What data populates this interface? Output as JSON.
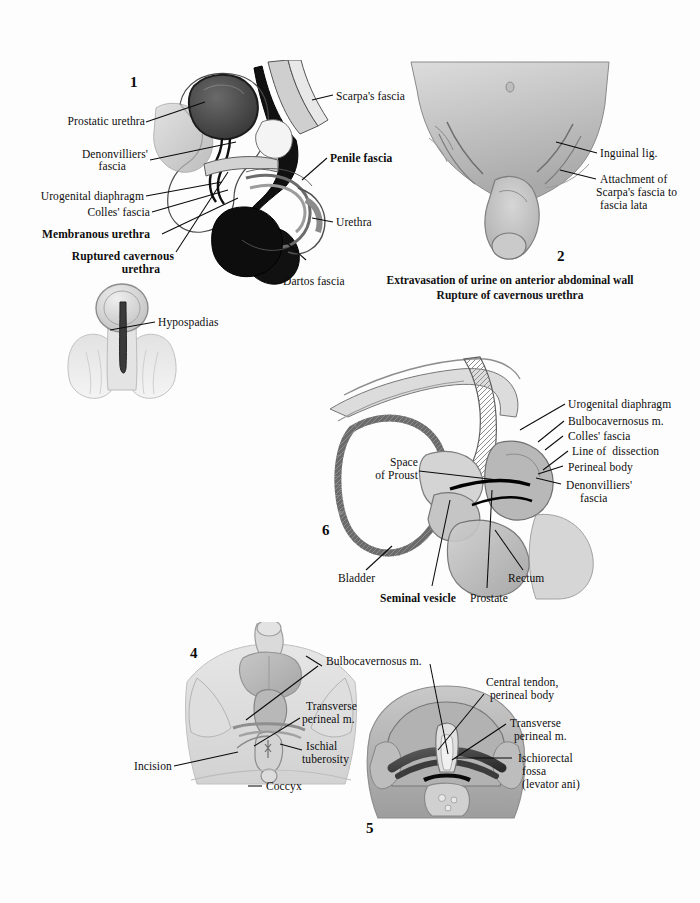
{
  "page": {
    "background": "#fdfdfd",
    "ink": "#0d0d0d",
    "kind": "anatomical-plate"
  },
  "figures": [
    {
      "number": "1",
      "name": "sagittal-section-ruptured-cavernous-urethra",
      "labels": [
        "Prostatic urethra",
        "Denonvilliers'\nfascia",
        "Urogenital diaphragm",
        "Colles' fascia",
        "Membranous urethra",
        "Ruptured cavernous\nurethra",
        "Scarpa's fascia",
        "Penile fascia",
        "Urethra",
        "Dartos fascia"
      ]
    },
    {
      "number": "2",
      "name": "extravasation-anterior-abdominal-wall",
      "labels": [
        "Inguinal lig.",
        "Attachment of\nScarpa's fascia to\nfascia lata"
      ],
      "caption": [
        "Extravasation of urine on anterior abdominal wall",
        "Rupture of cavernous urethra"
      ]
    },
    {
      "number": "3",
      "name": "hypospadias-figure",
      "labels": [
        "Hypospadias"
      ]
    },
    {
      "number": "6",
      "name": "perineal-prostatectomy-sagittal",
      "labels": [
        "Urogenital diaphragm",
        "Bulbocavernosus m.",
        "Colles' fascia",
        "Line of  dissection",
        "Perineal body",
        "Denonvilliers'\nfascia",
        "Space\nof Proust",
        "Bladder",
        "Seminal vesicle",
        "Prostate",
        "Rectum"
      ]
    },
    {
      "number": "4",
      "name": "perineal-surface-incision",
      "labels": [
        "Bulbocavernosus m.",
        "Transverse\nperineal m.",
        "Ischial\ntuberosity",
        "Incision",
        "Coccyx"
      ]
    },
    {
      "number": "5",
      "name": "perineal-dissection-exposure",
      "labels": [
        "Central tendon,\nperineal body",
        "Transverse\nperineal m.",
        "Ischiorectal\nfossa\n(levator ani)"
      ]
    }
  ],
  "fig1": {
    "num": "1",
    "l_prostatic_urethra": "Prostatic urethra",
    "l_denonvilliers": "Denonvilliers'",
    "l_denonvilliers2": "fascia",
    "l_urogenital": "Urogenital diaphragm",
    "l_colles": "Colles' fascia",
    "l_membranous": "Membranous urethra",
    "l_ruptured": "Ruptured cavernous",
    "l_ruptured2": "urethra",
    "l_scarpa": "Scarpa's fascia",
    "l_penile": "Penile fascia",
    "l_urethra": "Urethra",
    "l_dartos": "Dartos fascia"
  },
  "fig2": {
    "num": "2",
    "l_inguinal": "Inguinal lig.",
    "l_attach1": "Attachment of",
    "l_attach2": "Scarpa's fascia to",
    "l_attach3": "fascia lata",
    "cap1": "Extravasation of urine on anterior abdominal wall",
    "cap2": "Rupture of cavernous urethra"
  },
  "fig3": {
    "l_hypospadias": "Hypospadias"
  },
  "fig6": {
    "num": "6",
    "l_urogenital": "Urogenital diaphragm",
    "l_bulbo": "Bulbocavernosus m.",
    "l_colles": "Colles' fascia",
    "l_line": "Line of  dissection",
    "l_perineal_body": "Perineal body",
    "l_denon1": "Denonvilliers'",
    "l_denon2": "fascia",
    "l_space1": "Space",
    "l_space2": "of Proust",
    "l_bladder": "Bladder",
    "l_seminal": "Seminal vesicle",
    "l_prostate": "Prostate",
    "l_rectum": "Rectum"
  },
  "fig4": {
    "num": "4",
    "l_bulbo": "Bulbocavernosus m.",
    "l_trans1": "Transverse",
    "l_trans2": "perineal m.",
    "l_ischial1": "Ischial",
    "l_ischial2": "tuberosity",
    "l_incision": "Incision",
    "l_coccyx": "Coccyx"
  },
  "fig5": {
    "num": "5",
    "l_central1": "Central tendon,",
    "l_central2": "perineal body",
    "l_trans1": "Transverse",
    "l_trans2": "perineal m.",
    "l_fossa1": "Ischiorectal",
    "l_fossa2": "fossa",
    "l_fossa3": "(levator ani)"
  }
}
